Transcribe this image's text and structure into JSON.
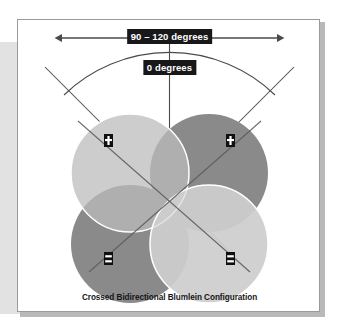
{
  "figure": {
    "caption": "Crossed Bidirectional Blumlein Configuration",
    "labels": {
      "spread_angle": "90 – 120 degrees",
      "axis_zero": "0 degrees"
    },
    "colors": {
      "page_background": "#ffffff",
      "panel_background": "#ffffff",
      "panel_border": "#9a9a9a",
      "panel_shadow": "#b9b9b9",
      "side_band": "#e2e2e2",
      "lobe_light": "#cdcdcd",
      "lobe_dark": "#8a8a8a",
      "lobe_outline": "#ffffff",
      "line": "#4a4a4a",
      "chip_background": "#18181a",
      "chip_text": "#ffffff",
      "caption_text": "#151515",
      "mic_body": "#101010",
      "mic_mark": "#ffffff"
    },
    "polar_lobes": [
      {
        "name": "top-left-lobe",
        "position": "top-left",
        "tone": "light",
        "polarity": "+"
      },
      {
        "name": "top-right-lobe",
        "position": "top-right",
        "tone": "dark",
        "polarity": "+"
      },
      {
        "name": "bottom-left-lobe",
        "position": "bottom-left",
        "tone": "dark",
        "polarity": "-"
      },
      {
        "name": "bottom-right-lobe",
        "position": "bottom-right",
        "tone": "light",
        "polarity": "-"
      }
    ],
    "microphones": [
      {
        "name": "mic-upper-left",
        "polarity_mark": "plus"
      },
      {
        "name": "mic-upper-right",
        "polarity_mark": "plus"
      },
      {
        "name": "mic-lower-left",
        "polarity_mark": "minus"
      },
      {
        "name": "mic-lower-right",
        "polarity_mark": "minus"
      }
    ],
    "annotations": {
      "arrow_style": "double-headed",
      "arc": "coverage-arc",
      "axis_line": "vertical-center-axis",
      "diagonals": [
        "left-diagonal-axis",
        "right-diagonal-axis"
      ]
    }
  }
}
